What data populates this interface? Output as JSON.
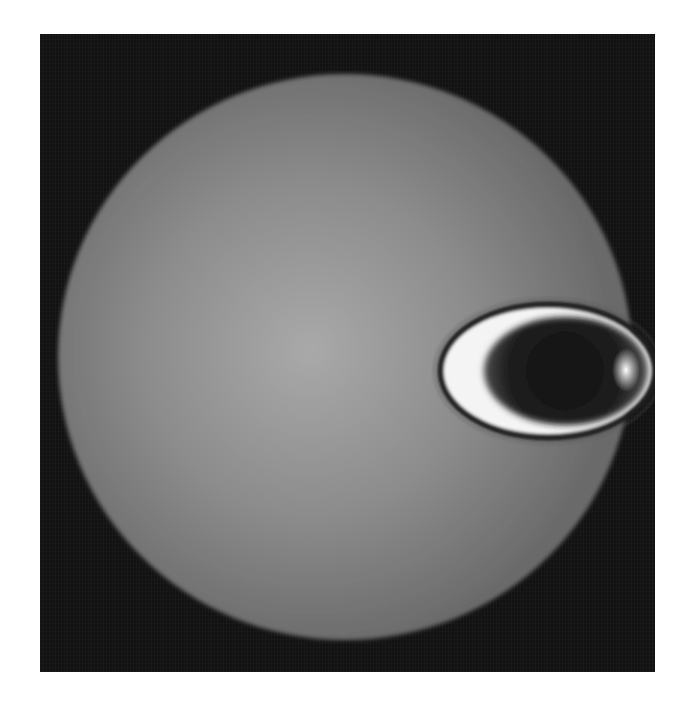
{
  "image": {
    "kind": "rendered sphere with elliptical bright ring",
    "canvas": {
      "width": 698,
      "height": 701,
      "background": "#ffffff"
    },
    "frame": {
      "x": 40,
      "y": 34,
      "width": 615,
      "height": 638,
      "color": "#121212"
    },
    "sphere": {
      "cx": 345,
      "cy": 357,
      "rx": 287,
      "ry": 283,
      "highlight_cx": 310,
      "highlight_cy": 350,
      "highlight_color": "#a9a9a9",
      "mid_color": "#8c8c8c",
      "edge_color": "#6b6b6b"
    },
    "ring": {
      "cx": 548,
      "cy": 371,
      "rx": 107,
      "ry": 66,
      "outer_outline_color": "#1e1e1e",
      "rim_color": "#f4f4f4",
      "inner_glow_color": "#7a7a7a",
      "core_color": "#161616",
      "bright_spot": {
        "cx": 626,
        "cy": 370,
        "color": "#ffffff"
      }
    }
  }
}
